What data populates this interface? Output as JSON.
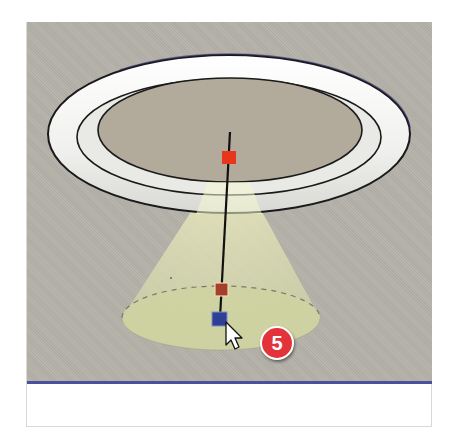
{
  "scene": {
    "description": "3D modeling viewport showing a ring light fixture with a spotlight cone",
    "background_color": "#b4b1a9",
    "axis_color": "#4a4f9e",
    "torus": {
      "fill": "#f4f4f2",
      "outline": "#1a1a1a",
      "disc_fill": "#b0a899"
    },
    "light_cone_color": "#d9dcaa",
    "handles": [
      {
        "name": "light-source-handle",
        "color": "#e8361c"
      },
      {
        "name": "cone-angle-handle",
        "color": "#a4402a"
      },
      {
        "name": "target-handle",
        "color": "#2e3f95"
      }
    ]
  },
  "callout": {
    "step_number": "5",
    "color": "#e2323a"
  },
  "cursor": {
    "type": "arrow-pointer"
  }
}
